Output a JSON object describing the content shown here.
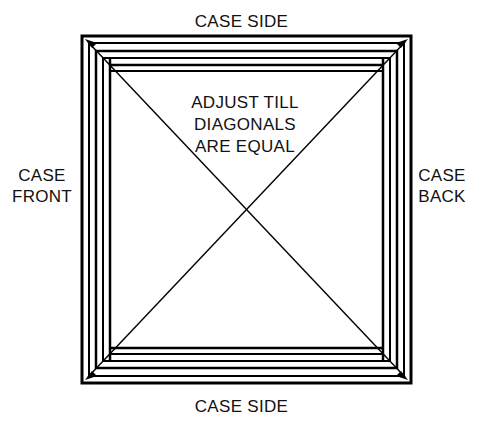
{
  "diagram": {
    "background_color": "#ffffff",
    "line_color": "#000000",
    "text_color": "#111111",
    "labels": {
      "top": "CASE SIDE",
      "bottom": "CASE SIDE",
      "left": "CASE\nFRONT",
      "right": "CASE\nBACK",
      "center_note": "ADJUST TILL\nDIAGONALS\nARE EQUAL"
    },
    "geometry": {
      "outer_frame": {
        "x1": 82,
        "y1": 36,
        "x2": 411,
        "y2": 383
      },
      "outer_rail_thickness": 7,
      "inner_frame": {
        "x1": 96,
        "y1": 51,
        "x2": 397,
        "y2": 368
      },
      "inner_rail_thickness": 6,
      "panel_frame": {
        "x1": 110,
        "y1": 65,
        "x2": 383,
        "y2": 354
      },
      "diagonals": [
        {
          "from": [
            86,
            40
          ],
          "to": [
            407,
            379
          ]
        },
        {
          "from": [
            407,
            40
          ],
          "to": [
            86,
            379
          ]
        }
      ],
      "arrowheads": [
        {
          "at": [
            86,
            40
          ],
          "points_to": "top-left"
        },
        {
          "at": [
            407,
            40
          ],
          "points_to": "top-right"
        },
        {
          "at": [
            86,
            379
          ],
          "points_to": "bottom-left"
        },
        {
          "at": [
            407,
            379
          ],
          "points_to": "bottom-right"
        }
      ]
    }
  }
}
